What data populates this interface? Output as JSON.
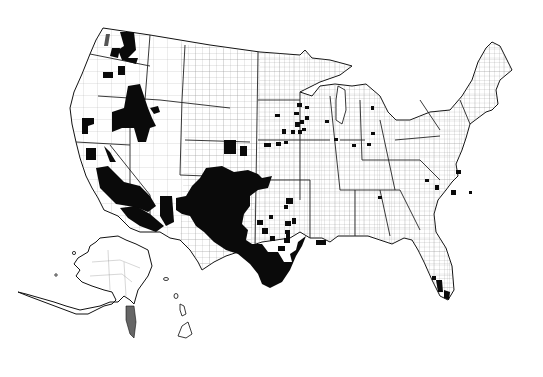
{
  "map": {
    "title": "",
    "subject": "United States county map with highlighted (black) counties",
    "colors": {
      "background": "#ffffff",
      "highlight": "#0a0a0a",
      "border": "#222222"
    },
    "regions_highlighted": [
      "Eastern Washington",
      "Northeast Oregon",
      "Southwest Idaho / Northern Nevada",
      "Northern California",
      "Southern California / Arizona",
      "New Mexico",
      "West and South Texas",
      "Scattered Great Plains and Midwest counties",
      "Scattered Carolinas counties",
      "South Florida"
    ],
    "insets": [
      "Alaska",
      "Hawaii"
    ]
  }
}
